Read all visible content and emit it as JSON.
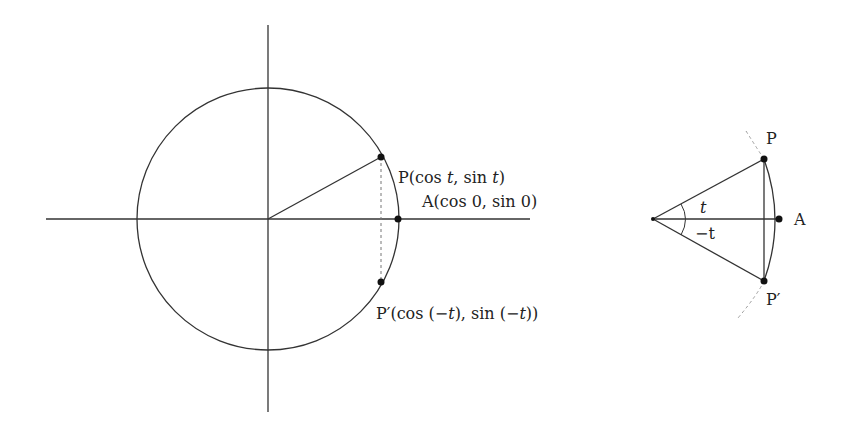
{
  "left_figure": {
    "label_P": "P(cos t, sin t)",
    "label_P_parts": [
      "P(cos ",
      "t",
      ", sin ",
      "t",
      ")"
    ],
    "label_A": "A(cos 0, sin 0)",
    "label_Pprime": "P′(cos (−t), sin (−t))",
    "label_Pprime_parts": [
      "P′(cos (−",
      "t",
      "), sin (−",
      "t",
      "))"
    ]
  },
  "right_figure": {
    "label_P": "P",
    "label_A": "A",
    "label_Pprime": "P′",
    "angle_top": "t",
    "angle_bottom": "−t"
  },
  "colors": {
    "stroke": "#333333",
    "dashed": "#888888"
  }
}
